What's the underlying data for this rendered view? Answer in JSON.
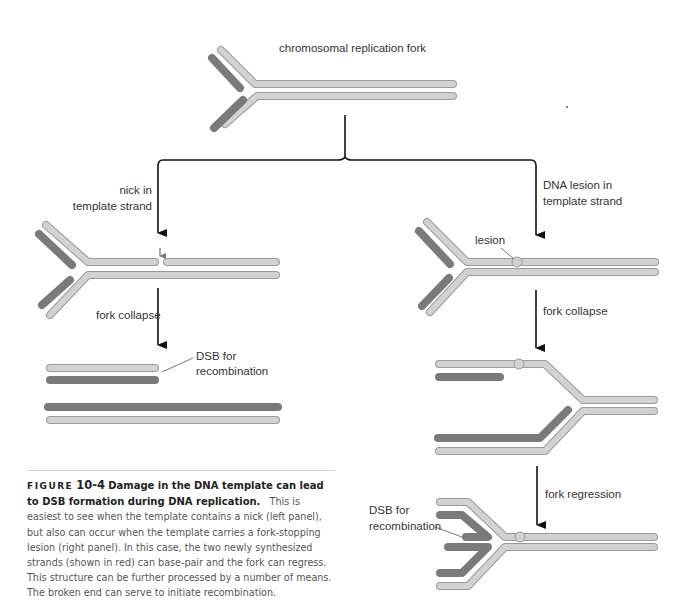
{
  "figure": {
    "top_label": "chromosomal replication fork",
    "left_panel": {
      "branch_label_line1": "nick in",
      "branch_label_line2": "template strand",
      "step_label": "fork collapse",
      "dsb_label_line1": "DSB for",
      "dsb_label_line2": "recombination"
    },
    "right_panel": {
      "branch_label_line1": "DNA lesion in",
      "branch_label_line2": "template strand",
      "lesion_label": "lesion",
      "step1_label": "fork collapse",
      "step2_label": "fork regression",
      "dsb_label_line1": "DSB for",
      "dsb_label_line2": "recombination"
    },
    "colors": {
      "template_strand": "#cfcfcf",
      "template_outline": "#9a9a9a",
      "new_strand": "#8a8a8a",
      "new_outline": "#6a6a6a",
      "arrow": "#111111"
    }
  },
  "caption": {
    "figure_word": "FIGURE",
    "figure_number": "10-4",
    "title": "Damage in the DNA template can lead to DSB formation during DNA replication.",
    "body": "This is easiest to see when the template contains a nick (left panel), but also can occur when the template carries a fork-stopping lesion (right panel). In this case, the two newly synthesized strands (shown in red) can base-pair and the fork can regress. This structure can be further processed by a number of means. The broken end can serve to initiate recombination."
  }
}
